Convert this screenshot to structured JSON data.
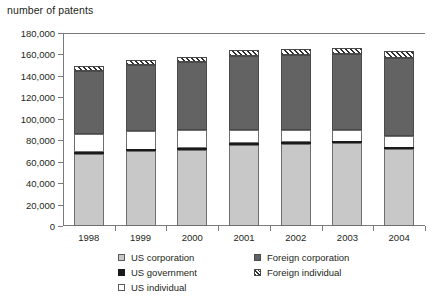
{
  "chart_data": {
    "type": "bar",
    "title": "number of patents",
    "subtitle": "",
    "xlabel": "",
    "ylabel": "number of patents",
    "categories": [
      "1998",
      "1999",
      "2000",
      "2001",
      "2002",
      "2003",
      "2004"
    ],
    "ylim": [
      0,
      180000
    ],
    "yticks": [
      0,
      20000,
      40000,
      60000,
      80000,
      100000,
      120000,
      140000,
      160000,
      180000
    ],
    "ytick_labels": [
      "0",
      "20,000",
      "40,000",
      "60,000",
      "80,000",
      "100,000",
      "120,000",
      "140,000",
      "160,000",
      "180,000"
    ],
    "grid": false,
    "stacked": true,
    "legend_position": "bottom",
    "series": [
      {
        "name": "US corporation",
        "color": "#c8c8c8",
        "pattern": "solid",
        "values": [
          67000,
          69500,
          71000,
          76000,
          76500,
          77000,
          71500
        ]
      },
      {
        "name": "US government",
        "color": "#1a1a1a",
        "pattern": "solid",
        "values": [
          2000,
          1500,
          1500,
          1500,
          1500,
          1500,
          1500
        ]
      },
      {
        "name": "US individual",
        "color": "#ffffff",
        "pattern": "solid",
        "values": [
          17000,
          17500,
          17000,
          12500,
          12000,
          11500,
          11000
        ]
      },
      {
        "name": "Foreign corporation",
        "color": "#636363",
        "pattern": "solid",
        "values": [
          59000,
          61500,
          63500,
          69000,
          69500,
          70000,
          73000
        ]
      },
      {
        "name": "Foreign individual",
        "color": "#2e2e2e",
        "pattern": "diagonal-hatch",
        "values": [
          4000,
          5000,
          5000,
          5500,
          5500,
          6000,
          6000
        ]
      }
    ],
    "totals": [
      149000,
      155000,
      158000,
      164500,
      165000,
      166000,
      163000
    ]
  },
  "chart": {
    "title": "number of patents",
    "axis": {
      "y_ticks": [
        {
          "label": "180,000",
          "value": 180000
        },
        {
          "label": "160,000",
          "value": 160000
        },
        {
          "label": "140,000",
          "value": 140000
        },
        {
          "label": "120,000",
          "value": 120000
        },
        {
          "label": "100,000",
          "value": 100000
        },
        {
          "label": "80,000",
          "value": 80000
        },
        {
          "label": "60,000",
          "value": 60000
        },
        {
          "label": "40,000",
          "value": 40000
        },
        {
          "label": "20,000",
          "value": 20000
        },
        {
          "label": "0",
          "value": 0
        }
      ],
      "x_ticks": [
        {
          "label": "1998"
        },
        {
          "label": "1999"
        },
        {
          "label": "2000"
        },
        {
          "label": "2001"
        },
        {
          "label": "2002"
        },
        {
          "label": "2003"
        },
        {
          "label": "2004"
        }
      ]
    },
    "legend": {
      "left_column": [
        {
          "label": "US corporation",
          "swatch": "us-corp"
        },
        {
          "label": "US government",
          "swatch": "us-gov"
        },
        {
          "label": "US individual",
          "swatch": "us-ind"
        }
      ],
      "right_column": [
        {
          "label": "Foreign corporation",
          "swatch": "for-corp"
        },
        {
          "label": "Foreign individual",
          "swatch": "for-ind"
        }
      ]
    }
  }
}
